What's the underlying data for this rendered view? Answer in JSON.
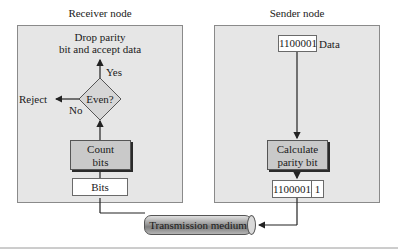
{
  "receiver": {
    "title": "Receiver node",
    "accept_label_line1": "Drop parity",
    "accept_label_line2": "bit and accept data",
    "yes_label": "Yes",
    "no_label": "No",
    "reject_label": "Reject",
    "decision_label": "Even?",
    "count_line1": "Count",
    "count_line2": "bits",
    "bits_label": "Bits"
  },
  "sender": {
    "title": "Sender node",
    "data_value": "1100001",
    "data_label": "Data",
    "calc_line1": "Calculate",
    "calc_line2": "parity bit",
    "output_data": "1100001",
    "output_parity": "1"
  },
  "medium": {
    "label": "Transmission medium"
  },
  "colors": {
    "panel_bg": "#e6e6e6",
    "process_bg": "#c9c9c9",
    "line": "#222222"
  }
}
